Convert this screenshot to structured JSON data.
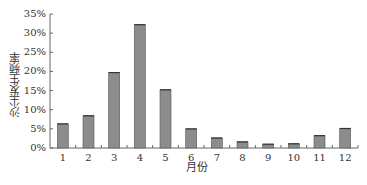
{
  "chart_data": {
    "type": "bar",
    "title": "",
    "xlabel": "月份",
    "ylabel": "沙尘发生频率",
    "categories": [
      "1",
      "2",
      "3",
      "4",
      "5",
      "6",
      "7",
      "8",
      "9",
      "10",
      "11",
      "12"
    ],
    "values": [
      6.3,
      8.4,
      19.7,
      32.2,
      15.2,
      5.0,
      2.6,
      1.6,
      1.0,
      1.1,
      3.2,
      5.1
    ],
    "unit": "%",
    "ylim": [
      0,
      35
    ],
    "yticks": [
      "0%",
      "5%",
      "10%",
      "15%",
      "20%",
      "25%",
      "30%",
      "35%"
    ],
    "grid": false,
    "legend": null,
    "bar_color": "#8c8c8c",
    "bar_edge_color": "#555555"
  }
}
